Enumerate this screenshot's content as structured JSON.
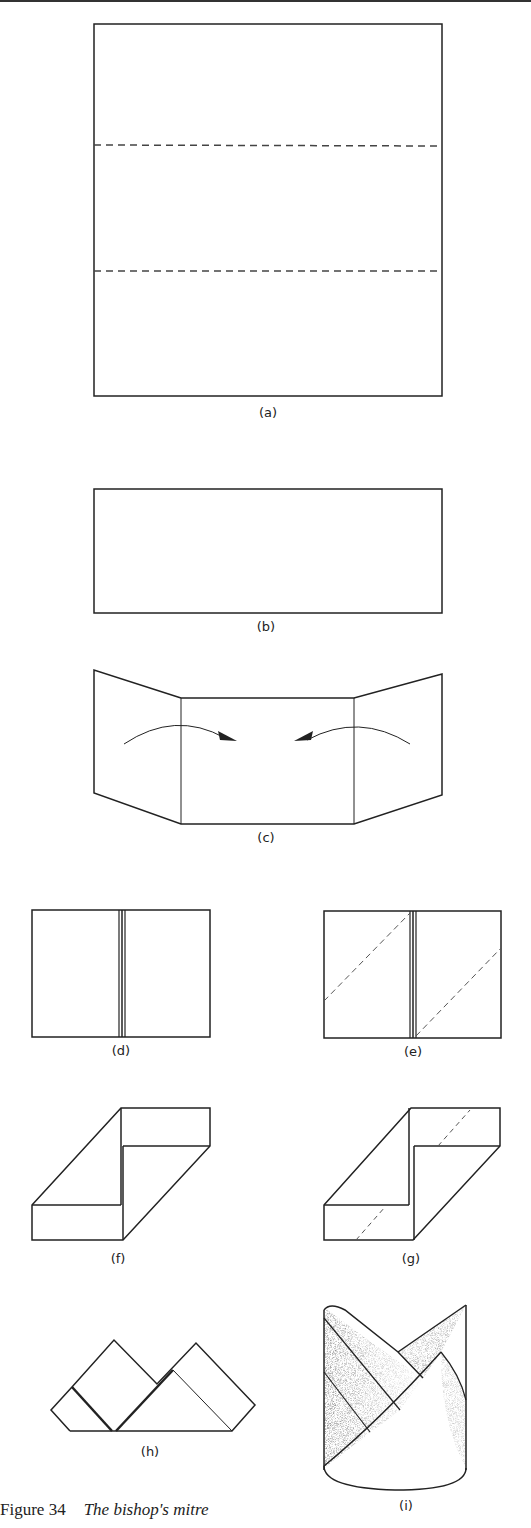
{
  "figure": {
    "number": "Figure 34",
    "title": "The bishop's mitre"
  },
  "panels": [
    {
      "id": "a",
      "label": "(a)",
      "description": "Square napkin with two horizontal dashed fold lines dividing it into thirds"
    },
    {
      "id": "b",
      "label": "(b)",
      "description": "Napkin folded into a horizontal rectangle"
    },
    {
      "id": "c",
      "label": "(c)",
      "description": "Left and right ends folded inward toward the centre, indicated by curved arrows"
    },
    {
      "id": "d",
      "label": "(d)",
      "description": "Ends meet at the centre seam"
    },
    {
      "id": "e",
      "label": "(e)",
      "description": "Diagonal dashed fold lines on each half"
    },
    {
      "id": "f",
      "label": "(f)",
      "description": "Corners folded diagonally forming a parallelogram shape"
    },
    {
      "id": "g",
      "label": "(g)",
      "description": "Parallelogram with further diagonal dashed fold lines"
    },
    {
      "id": "h",
      "label": "(h)",
      "description": "Turned over, showing two peaked points"
    },
    {
      "id": "i",
      "label": "(i)",
      "description": "Finished bishop's mitre standing upright, shaded"
    }
  ],
  "colors": {
    "line": "#222222",
    "dash": "#555555",
    "shade": "#8a8a8a"
  }
}
